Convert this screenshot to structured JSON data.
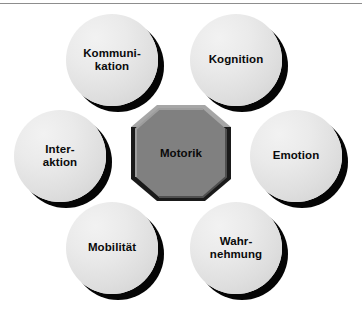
{
  "figure": {
    "type": "hexagonal-hub-and-spoke",
    "center": {
      "label": "Motorik",
      "shape": "hexagon",
      "fill_color": "#808080",
      "bevel_light_color": "#a6a6a6",
      "bevel_dark_color": "#1a1a1a",
      "text_color": "#0a0a0a"
    },
    "nodes": [
      {
        "id": "kommunikation",
        "label": "Kommuni-\nkation",
        "position": "top-left"
      },
      {
        "id": "kognition",
        "label": "Kognition",
        "position": "top-right"
      },
      {
        "id": "interaktion",
        "label": "Inter-\naktion",
        "position": "middle-left"
      },
      {
        "id": "emotion",
        "label": "Emotion",
        "position": "middle-right"
      },
      {
        "id": "mobilitaet",
        "label": "Mobilität",
        "position": "bottom-left"
      },
      {
        "id": "wahrnehmung",
        "label": "Wahr-\nnehmung",
        "position": "bottom-right"
      }
    ],
    "style": {
      "background_color": "#ffffff",
      "node_fill_light": "#f2f2f2",
      "node_fill_dark": "#cfcfcf",
      "node_shadow_color": "#050505",
      "node_text_color": "#0a0a0a",
      "top_rule_color": "#8d8d8d"
    }
  }
}
